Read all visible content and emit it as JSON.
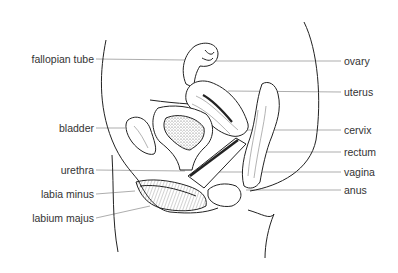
{
  "diagram": {
    "colors": {
      "line": "#222222",
      "leader": "#888888",
      "text": "#333333",
      "stipple": "#555555"
    },
    "labels_left": [
      {
        "text": "fallopian tube",
        "y": 59,
        "right_x": 94,
        "target": [
          180,
          60
        ]
      },
      {
        "text": "bladder",
        "y": 128,
        "right_x": 94,
        "target": [
          125,
          128
        ]
      },
      {
        "text": "urethra",
        "y": 170,
        "right_x": 94,
        "target": [
          185,
          170
        ]
      },
      {
        "text": "labia minus",
        "y": 194,
        "right_x": 94,
        "target": [
          140,
          190
        ]
      },
      {
        "text": "labium majus",
        "y": 218,
        "right_x": 94,
        "target": [
          150,
          205
        ]
      }
    ],
    "labels_right": [
      {
        "text": "ovary",
        "y": 61,
        "left_x": 343,
        "target": [
          220,
          60
        ]
      },
      {
        "text": "uterus",
        "y": 92,
        "left_x": 343,
        "target": [
          235,
          90
        ]
      },
      {
        "text": "cervix",
        "y": 130,
        "left_x": 343,
        "target": [
          245,
          130
        ]
      },
      {
        "text": "rectum",
        "y": 152,
        "left_x": 343,
        "target": [
          255,
          152
        ]
      },
      {
        "text": "vagina",
        "y": 172,
        "left_x": 343,
        "target": [
          230,
          172
        ]
      },
      {
        "text": "anus",
        "y": 190,
        "left_x": 343,
        "target": [
          250,
          190
        ]
      }
    ]
  }
}
